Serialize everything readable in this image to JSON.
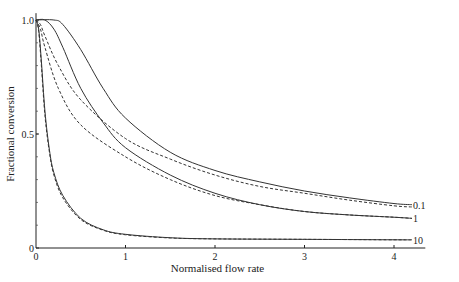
{
  "chart_data": {
    "type": "line",
    "title": "",
    "xlabel": "Normalised flow rate",
    "ylabel": "Fractional conversion",
    "xlim": [
      0,
      4.35
    ],
    "ylim": [
      0,
      1.05
    ],
    "x_ticks": [
      "0",
      "1",
      "2",
      "3",
      "4"
    ],
    "y_ticks": [
      "0",
      "0.5",
      "1.0"
    ],
    "grid": false,
    "legend": "inline labels at right end of curves",
    "series": [
      {
        "name": "0.1 (solid)",
        "label": "0.1",
        "style": "solid",
        "x": [
          0,
          0.2,
          0.3,
          0.5,
          0.75,
          1.0,
          1.5,
          2.0,
          2.5,
          3.0,
          3.5,
          4.0,
          4.2
        ],
        "y": [
          1.0,
          1.0,
          0.98,
          0.87,
          0.7,
          0.57,
          0.42,
          0.34,
          0.29,
          0.25,
          0.22,
          0.195,
          0.19
        ]
      },
      {
        "name": "0.1 (dashed)",
        "label": "",
        "style": "dashed",
        "x": [
          0,
          0.05,
          0.1,
          0.25,
          0.5,
          1.0,
          1.5,
          2.0,
          2.5,
          3.0,
          3.5,
          4.0,
          4.2
        ],
        "y": [
          1.0,
          0.98,
          0.93,
          0.8,
          0.65,
          0.48,
          0.39,
          0.32,
          0.27,
          0.24,
          0.21,
          0.185,
          0.18
        ]
      },
      {
        "name": "1 (solid)",
        "label": "1",
        "style": "solid",
        "x": [
          0,
          0.1,
          0.2,
          0.3,
          0.5,
          0.75,
          1.0,
          1.5,
          2.0,
          2.5,
          3.0,
          3.5,
          4.0,
          4.2
        ],
        "y": [
          1.0,
          1.0,
          0.96,
          0.88,
          0.7,
          0.55,
          0.44,
          0.32,
          0.24,
          0.19,
          0.16,
          0.145,
          0.135,
          0.13
        ]
      },
      {
        "name": "1 (dashed)",
        "label": "",
        "style": "dashed",
        "x": [
          0,
          0.05,
          0.1,
          0.25,
          0.5,
          1.0,
          1.5,
          2.0,
          2.5,
          3.0,
          3.5,
          4.0,
          4.2
        ],
        "y": [
          1.0,
          0.96,
          0.88,
          0.7,
          0.54,
          0.4,
          0.3,
          0.23,
          0.19,
          0.16,
          0.145,
          0.135,
          0.13
        ]
      },
      {
        "name": "10 (solid)",
        "label": "10",
        "style": "solid",
        "x": [
          0,
          0.03,
          0.06,
          0.1,
          0.15,
          0.2,
          0.3,
          0.5,
          0.75,
          1.0,
          1.5,
          2.0,
          3.0,
          4.0,
          4.2
        ],
        "y": [
          1.0,
          0.96,
          0.82,
          0.6,
          0.43,
          0.33,
          0.23,
          0.13,
          0.08,
          0.06,
          0.045,
          0.04,
          0.038,
          0.036,
          0.036
        ]
      },
      {
        "name": "10 (dashed)",
        "label": "",
        "style": "dashed",
        "x": [
          0,
          0.03,
          0.06,
          0.1,
          0.15,
          0.2,
          0.3,
          0.5,
          0.75,
          1.0,
          1.5,
          2.0,
          3.0,
          4.0,
          4.2
        ],
        "y": [
          1.0,
          0.95,
          0.8,
          0.58,
          0.42,
          0.32,
          0.22,
          0.125,
          0.078,
          0.058,
          0.044,
          0.04,
          0.038,
          0.036,
          0.036
        ]
      }
    ]
  },
  "labels": {
    "xlabel": "Normalised flow rate",
    "ylabel": "Fractional conversion"
  }
}
